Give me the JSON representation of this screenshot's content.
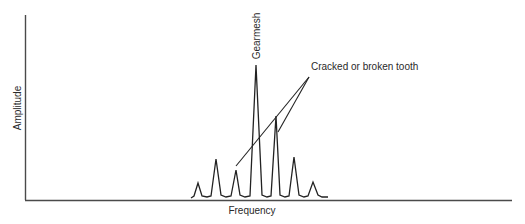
{
  "diagram": {
    "type": "spectrum",
    "xlabel": "Frequency",
    "ylabel": "Amplitude",
    "annotations": {
      "gearmesh": "Gearmesh",
      "fault": "Cracked or broken tooth"
    },
    "colors": {
      "axis": "#4a4a4a",
      "line": "#222222",
      "text": "#2a2a2a",
      "background": "#ffffff"
    },
    "peaks": [
      {
        "x": 198,
        "y": 183,
        "label": "sideband"
      },
      {
        "x": 216,
        "y": 159,
        "label": "sideband"
      },
      {
        "x": 236,
        "y": 170,
        "label": "sideband (cracked/broken tooth)"
      },
      {
        "x": 256,
        "y": 65,
        "label": "Gearmesh"
      },
      {
        "x": 276,
        "y": 116,
        "label": "sideband (cracked/broken tooth)"
      },
      {
        "x": 294,
        "y": 157,
        "label": "sideband"
      },
      {
        "x": 313,
        "y": 182,
        "label": "sideband"
      }
    ]
  }
}
